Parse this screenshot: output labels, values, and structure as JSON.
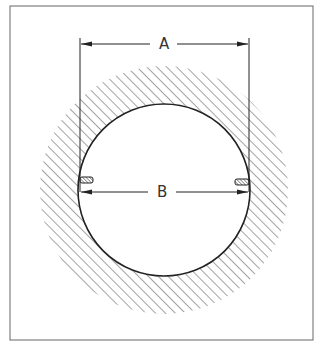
{
  "diagram": {
    "type": "technical-drawing",
    "dimensions": [
      {
        "id": "A",
        "label": "A",
        "meaning": "outer width between vertical extension lines"
      },
      {
        "id": "B",
        "label": "B",
        "meaning": "inner bore diameter"
      }
    ],
    "colors": {
      "line": "#222222",
      "hatch": "#555555",
      "background": "#ffffff",
      "border": "#666666"
    }
  }
}
